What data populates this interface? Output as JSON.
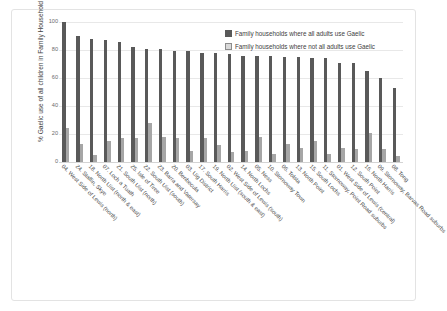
{
  "chart_data": {
    "type": "bar",
    "title": "",
    "xlabel": "",
    "ylabel": "% Gaelic use of all children in Family Household",
    "ylim": [
      0,
      100
    ],
    "yticks": [
      0,
      20,
      40,
      60,
      80,
      100
    ],
    "grid": true,
    "legend_position": "top-right",
    "categories": [
      "04. West Side of Lewis (north)",
      "24. Staffin, Skye",
      "18. North Uist (north & east)",
      "07. Loch a Tuath",
      "21. South Uist (north)",
      "25. Isle of Tiree",
      "22. South Uist (south)",
      "23. Barra and Vatersay",
      "20. Benbecula",
      "03. Uig District",
      "17. South Harris",
      "19. North Uist (south & east)",
      "02. West Side of Lewis (south)",
      "14. North Lochs",
      "05. Ness",
      "10. Stornoway Town",
      "06. Tolsta",
      "13. North Point",
      "15. South Lochs",
      "11. Stornoway, Point Road suburbs",
      "01. West Side of Lewis (central)",
      "12. South Point",
      "16. North Harris",
      "09. Stornoway, Barvas Road suburbs",
      "08. Tong"
    ],
    "series": [
      {
        "name": "Family households where all adults use Gaelic",
        "color": "#595959",
        "values": [
          100,
          90,
          88,
          87,
          86,
          82,
          81,
          81,
          79,
          79,
          78,
          78,
          77,
          76,
          76,
          76,
          75,
          75,
          74,
          74,
          71,
          71,
          65,
          60,
          53
        ]
      },
      {
        "name": "Family households where not all adults use Gaelic",
        "color": "#a6a6a6",
        "values": [
          24,
          13,
          5,
          15,
          17,
          17,
          28,
          18,
          17,
          8,
          17,
          12,
          7,
          8,
          18,
          6,
          13,
          10,
          15,
          6,
          10,
          9,
          21,
          9,
          4
        ]
      }
    ]
  }
}
